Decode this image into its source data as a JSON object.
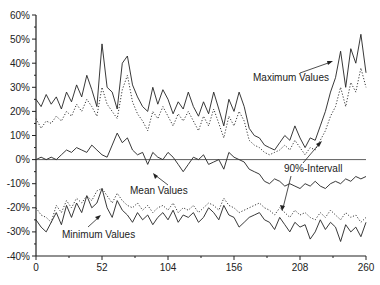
{
  "chart_data": {
    "type": "line",
    "title": "",
    "xlabel": "",
    "ylabel": "",
    "xlim": [
      0,
      260
    ],
    "ylim": [
      -40,
      60
    ],
    "x_ticks": [
      0,
      52,
      104,
      156,
      208,
      260
    ],
    "y_ticks": [
      "-40%",
      "-30%",
      "-20%",
      "-10%",
      "0%",
      "10%",
      "20%",
      "30%",
      "40%",
      "50%",
      "60%"
    ],
    "grid": false,
    "legend": null,
    "annotations": [
      "Maximum Values",
      "Mean Values",
      "Minimum Values",
      "90%-Intervall"
    ],
    "x": [
      0,
      4,
      8,
      12,
      16,
      20,
      24,
      28,
      32,
      36,
      40,
      44,
      48,
      52,
      56,
      60,
      64,
      68,
      72,
      76,
      80,
      84,
      88,
      92,
      96,
      100,
      104,
      108,
      112,
      116,
      120,
      124,
      128,
      132,
      136,
      140,
      144,
      148,
      152,
      156,
      160,
      164,
      168,
      172,
      176,
      180,
      184,
      188,
      192,
      196,
      200,
      204,
      208,
      212,
      216,
      220,
      224,
      228,
      232,
      236,
      240,
      244,
      248,
      252,
      256,
      260
    ],
    "series": [
      {
        "name": "Maximum Values",
        "style": "solid",
        "values": [
          25,
          22,
          27,
          23,
          26,
          21,
          28,
          24,
          31,
          26,
          35,
          29,
          22,
          48,
          30,
          28,
          21,
          40,
          43,
          31,
          26,
          22,
          20,
          30,
          23,
          29,
          25,
          19,
          24,
          21,
          28,
          22,
          18,
          24,
          19,
          28,
          21,
          14,
          25,
          20,
          28,
          22,
          13,
          10,
          9,
          6,
          5,
          4,
          7,
          10,
          8,
          14,
          9,
          5,
          9,
          8,
          14,
          20,
          28,
          34,
          45,
          30,
          46,
          40,
          52,
          36
        ]
      },
      {
        "name": "90%-Intervall Upper",
        "style": "dotted",
        "values": [
          17,
          13,
          16,
          15,
          18,
          16,
          20,
          18,
          23,
          20,
          25,
          22,
          18,
          30,
          23,
          20,
          17,
          29,
          35,
          24,
          19,
          16,
          12,
          20,
          17,
          22,
          18,
          14,
          19,
          16,
          20,
          16,
          12,
          18,
          14,
          21,
          15,
          9,
          18,
          14,
          20,
          16,
          8,
          6,
          5,
          3,
          2,
          3,
          4,
          6,
          4,
          8,
          5,
          2,
          5,
          4,
          8,
          12,
          18,
          22,
          30,
          22,
          32,
          28,
          38,
          30
        ]
      },
      {
        "name": "Mean Values",
        "style": "solid",
        "values": [
          0,
          1,
          0,
          1,
          0,
          2,
          4,
          3,
          5,
          4,
          3,
          6,
          4,
          2,
          1,
          6,
          11,
          7,
          9,
          4,
          2,
          3,
          -2,
          3,
          1,
          0,
          3,
          1,
          -2,
          -5,
          -2,
          1,
          0,
          2,
          -2,
          -1,
          0,
          -4,
          3,
          1,
          0,
          -1,
          -4,
          -5,
          -6,
          -9,
          -10,
          -8,
          -9,
          -11,
          -10,
          -11,
          -12,
          -10,
          -11,
          -9,
          -11,
          -12,
          -10,
          -9,
          -10,
          -8,
          -9,
          -7,
          -8,
          -7
        ]
      },
      {
        "name": "90%-Intervall Lower",
        "style": "dotted",
        "values": [
          -20,
          -23,
          -24,
          -26,
          -19,
          -22,
          -17,
          -20,
          -16,
          -18,
          -15,
          -17,
          -13,
          -12,
          -15,
          -18,
          -14,
          -17,
          -19,
          -20,
          -18,
          -21,
          -19,
          -22,
          -20,
          -19,
          -21,
          -18,
          -22,
          -20,
          -21,
          -19,
          -22,
          -20,
          -18,
          -19,
          -21,
          -16,
          -19,
          -20,
          -22,
          -21,
          -20,
          -19,
          -18,
          -20,
          -21,
          -23,
          -20,
          -22,
          -24,
          -21,
          -23,
          -22,
          -24,
          -25,
          -22,
          -24,
          -21,
          -23,
          -25,
          -22,
          -24,
          -23,
          -26,
          -24
        ]
      },
      {
        "name": "Minimum Values",
        "style": "solid",
        "values": [
          -25,
          -28,
          -30,
          -26,
          -22,
          -27,
          -19,
          -24,
          -18,
          -22,
          -15,
          -20,
          -18,
          -12,
          -20,
          -24,
          -17,
          -21,
          -23,
          -26,
          -22,
          -25,
          -23,
          -27,
          -24,
          -22,
          -25,
          -21,
          -26,
          -23,
          -24,
          -22,
          -26,
          -24,
          -20,
          -22,
          -25,
          -19,
          -23,
          -24,
          -28,
          -26,
          -24,
          -23,
          -22,
          -25,
          -26,
          -29,
          -24,
          -27,
          -30,
          -26,
          -28,
          -27,
          -33,
          -30,
          -25,
          -29,
          -26,
          -28,
          -34,
          -27,
          -30,
          -28,
          -32,
          -26
        ]
      }
    ]
  },
  "labels": {
    "max": "Maximum Values",
    "mean": "Mean Values",
    "min": "Minimum Values",
    "interval": "90%-Intervall"
  }
}
